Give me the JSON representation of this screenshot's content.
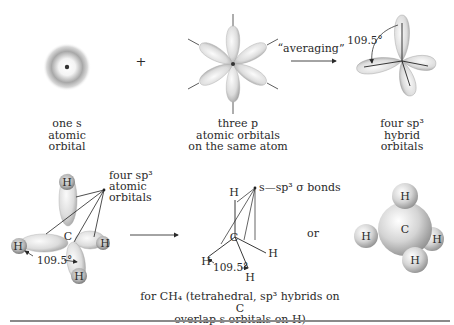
{
  "top_row": {
    "s_orbital": {
      "caption": [
        "one s",
        "atomic",
        "orbital"
      ]
    },
    "plus_sign": "+",
    "p_orbitals": {
      "caption": [
        "three p",
        "atomic orbitals",
        "on the same atom"
      ]
    },
    "arrow_label": "“averaging”",
    "sp3_orbitals": {
      "caption": [
        "four sp³",
        "hybrid",
        "orbitals"
      ],
      "angle_label": "109.5°"
    }
  },
  "bottom_row": {
    "orbital_model": {
      "label": [
        "four sp³",
        "atomic",
        "orbitals"
      ],
      "center_atom": "C",
      "atoms": [
        "H",
        "H",
        "H",
        "H"
      ],
      "angle_label": "109.5°"
    },
    "line_model": {
      "label": "s—sp³ σ bonds",
      "center_atom": "C",
      "atoms": [
        "H",
        "H",
        "H",
        "H"
      ],
      "angle_label": "109.5°"
    },
    "or_text": "or",
    "space_filling_model": {
      "center_atom": "C",
      "atoms": [
        "H",
        "H",
        "H",
        "H"
      ]
    },
    "caption": [
      "for CH₄ (tetrahedral, sp³ hybrids on C",
      "overlap s orbitals on H)"
    ]
  },
  "colors": {
    "ink": "#2a2a2a",
    "lobe_light": "#f2f2f2",
    "lobe_dark": "#9a9a9a",
    "rule": "#8a8a8a"
  }
}
